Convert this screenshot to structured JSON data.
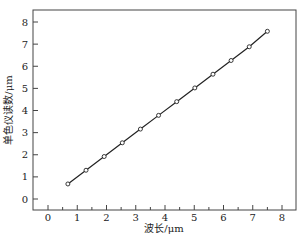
{
  "chart_data": {
    "type": "line",
    "title": "",
    "xlabel": "波长/μm",
    "ylabel": "单色仪读数/μm",
    "xlim": [
      -0.35,
      8.6
    ],
    "ylim": [
      -0.6,
      8.6
    ],
    "xticks": [
      "0",
      "1",
      "2",
      "3",
      "4",
      "5",
      "6",
      "7",
      "8"
    ],
    "yticks": [
      "0",
      "1",
      "2",
      "3",
      "4",
      "5",
      "6",
      "7",
      "8"
    ],
    "grid": false,
    "legend": null,
    "series": [
      {
        "name": "calibration",
        "marker": "open-circle",
        "x": [
          0.68,
          1.3,
          1.92,
          2.54,
          3.16,
          3.78,
          4.4,
          5.02,
          5.64,
          6.26,
          6.88,
          7.5
        ],
        "y": [
          0.68,
          1.3,
          1.92,
          2.54,
          3.16,
          3.78,
          4.4,
          5.02,
          5.64,
          6.26,
          6.88,
          7.58
        ]
      }
    ]
  }
}
